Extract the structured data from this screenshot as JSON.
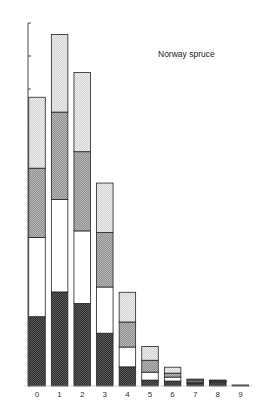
{
  "chart_data": {
    "type": "bar",
    "stacked": true,
    "title": "",
    "annotation": "Norway spruce",
    "xlabel": "",
    "ylabel": "",
    "categories": [
      "0",
      "1",
      "2",
      "3",
      "4",
      "5",
      "6",
      "7",
      "8",
      "9"
    ],
    "series": [
      {
        "name": "dark (bottom)",
        "fill": "#3a3a3a",
        "pattern": "dense-dots-dark",
        "values": [
          2.1,
          2.85,
          2.5,
          1.6,
          0.58,
          0.18,
          0.15,
          0.09,
          0.12,
          0.02
        ]
      },
      {
        "name": "white",
        "fill": "#ffffff",
        "pattern": "none",
        "values": [
          2.4,
          2.8,
          2.2,
          1.4,
          0.6,
          0.24,
          0.12,
          0.03,
          0.03,
          0.0
        ]
      },
      {
        "name": "medium grey",
        "fill": "#9a9a9a",
        "pattern": "dots-medium",
        "values": [
          2.1,
          2.65,
          2.4,
          1.65,
          0.76,
          0.36,
          0.12,
          0.06,
          0.02,
          0.01
        ]
      },
      {
        "name": "light grey (top)",
        "fill": "#d8d8d8",
        "pattern": "dots-light",
        "values": [
          2.15,
          2.35,
          2.4,
          1.5,
          0.9,
          0.42,
          0.18,
          0.03,
          0.01,
          0.0
        ]
      }
    ],
    "ylim": [
      0,
      11
    ],
    "yticks": [
      0,
      1,
      2,
      3,
      4,
      5,
      6,
      7,
      8,
      9,
      10,
      11
    ],
    "ytick_labels_shown": false,
    "grid": false,
    "legend": null
  }
}
